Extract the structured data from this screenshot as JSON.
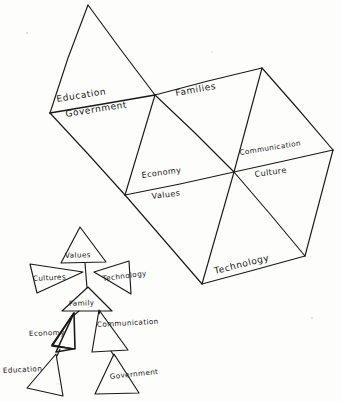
{
  "figure": {
    "background_color": "#fdfdfb",
    "ink_color": "#1a1a1a"
  },
  "upper_diagram": {
    "name": "tessellated-triangle-strip",
    "labels": {
      "education": "Education",
      "government": "Government",
      "families": "Families",
      "economy": "Economy",
      "values": "Values",
      "communication": "Communication",
      "culture": "Culture",
      "technology": "Technology"
    }
  },
  "lower_diagram": {
    "name": "arrow-triangle-hierarchy",
    "labels": {
      "values": "Values",
      "culture": "Cultures",
      "technology": "Technology",
      "family": "Family",
      "economy": "Economy",
      "communication": "Communication",
      "education": "Education",
      "government": "Government"
    }
  }
}
